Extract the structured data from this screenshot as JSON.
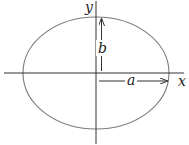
{
  "diagram": {
    "labels": {
      "x_axis": "x",
      "y_axis": "y",
      "semi_major": "a",
      "semi_minor": "b"
    },
    "ellipse": {
      "cx": 96,
      "cy": 73,
      "rx": 73,
      "ry": 56
    },
    "colors": {
      "curve": "#7a7a7a",
      "axes": "#333333",
      "arrows": "#333333",
      "text": "#222222"
    }
  }
}
